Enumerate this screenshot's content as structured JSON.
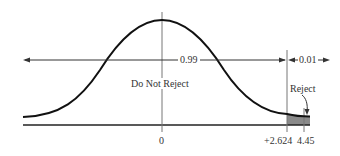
{
  "diagram": {
    "type": "normal-distribution-rejection-region",
    "labels": {
      "acceptance_prob": "0.99",
      "rejection_prob": "0.01",
      "do_not_reject": "Do Not Reject",
      "reject": "Reject"
    },
    "x_ticks": [
      {
        "label": "0"
      },
      {
        "label": "+2.624"
      },
      {
        "label": "4.45"
      }
    ],
    "colors": {
      "curve": "#111111",
      "axis": "#222222",
      "guide": "#777777",
      "shade": "#888888"
    }
  }
}
